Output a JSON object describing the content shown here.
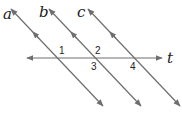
{
  "diagram": {
    "line_color": "#6e6e6e",
    "lines": [
      {
        "id": "a",
        "label": "a",
        "x1": 11,
        "y1": 9,
        "x2": 103,
        "y2": 106,
        "label_x": 3,
        "label_y": 19
      },
      {
        "id": "b",
        "label": "b",
        "x1": 49,
        "y1": 9,
        "x2": 141,
        "y2": 106,
        "label_x": 39,
        "label_y": 17
      },
      {
        "id": "c",
        "label": "c",
        "x1": 88,
        "y1": 9,
        "x2": 180,
        "y2": 106,
        "label_x": 77,
        "label_y": 17
      }
    ],
    "transversal": {
      "id": "t",
      "label": "t",
      "x1": 27,
      "y1": 58,
      "x2": 162,
      "y2": 58,
      "label_x": 167,
      "label_y": 63
    },
    "angles": [
      {
        "label": "1",
        "x": 59,
        "y": 54
      },
      {
        "label": "2",
        "x": 95,
        "y": 54
      },
      {
        "label": "3",
        "x": 91,
        "y": 70
      },
      {
        "label": "4",
        "x": 130,
        "y": 70
      }
    ]
  }
}
